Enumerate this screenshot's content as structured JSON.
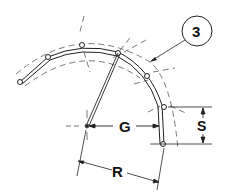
{
  "diagram": {
    "callout": {
      "number": "3"
    },
    "dimensions": {
      "gap_label": "G",
      "spacing_label": "S",
      "radius_label": "R"
    },
    "colors": {
      "line": "#222222",
      "dash": "#555555",
      "background": "#ffffff"
    }
  }
}
